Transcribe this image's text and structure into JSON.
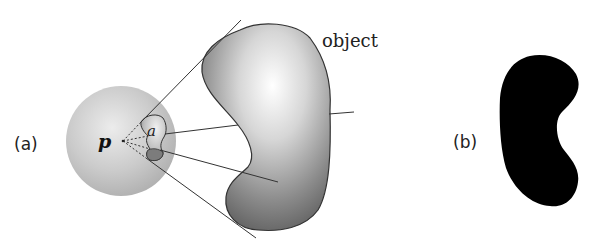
{
  "figure": {
    "panel_a": {
      "label": "(a)",
      "point_label": "p",
      "patch_label": "a",
      "object_label": "object"
    },
    "panel_b": {
      "label": "(b)"
    }
  },
  "colors": {
    "sphere_fill": "#c8c8c8",
    "object_dark": "#6e6e6e",
    "object_light": "#f8f8f8",
    "outline": "#333333",
    "silhouette": "#000000"
  }
}
